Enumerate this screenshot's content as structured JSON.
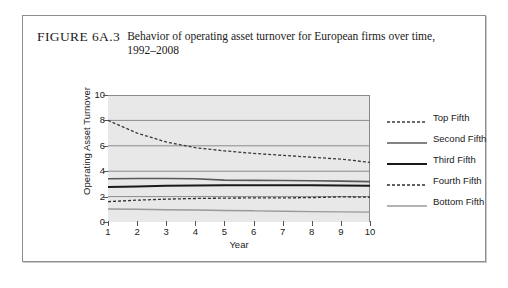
{
  "caption": {
    "label": "FIGURE 6A.3",
    "text": "Behavior of operating asset turnover for European firms over time, 1992–2008"
  },
  "chart_data": {
    "type": "line",
    "title": "Behavior of operating asset turnover for European firms over time, 1992–2008",
    "xlabel": "Year",
    "ylabel": "Operating Asset Turnover",
    "x": [
      1,
      2,
      3,
      4,
      5,
      6,
      7,
      8,
      9,
      10
    ],
    "xlim": [
      1,
      10
    ],
    "ylim": [
      0,
      10
    ],
    "yticks": [
      0,
      2,
      4,
      6,
      8,
      10
    ],
    "xticks": [
      1,
      2,
      3,
      4,
      5,
      6,
      7,
      8,
      9,
      10
    ],
    "grid": true,
    "legend_position": "right",
    "series": [
      {
        "name": "Top Fifth",
        "style": "dashed",
        "color": "#3a3a3a",
        "width": 1.3,
        "values": [
          8.0,
          7.0,
          6.3,
          5.85,
          5.6,
          5.4,
          5.25,
          5.1,
          4.95,
          4.7
        ]
      },
      {
        "name": "Second Fifth",
        "style": "solid",
        "color": "#585858",
        "width": 1.6,
        "values": [
          3.4,
          3.42,
          3.43,
          3.4,
          3.3,
          3.28,
          3.27,
          3.25,
          3.22,
          3.18
        ]
      },
      {
        "name": "Third Fifth",
        "style": "solid",
        "color": "#1a1a1a",
        "width": 2.0,
        "values": [
          2.75,
          2.8,
          2.85,
          2.88,
          2.9,
          2.9,
          2.9,
          2.9,
          2.88,
          2.85
        ]
      },
      {
        "name": "Fourth Fifth",
        "style": "dashed",
        "color": "#2e2e2e",
        "width": 1.3,
        "values": [
          1.6,
          1.72,
          1.8,
          1.85,
          1.88,
          1.9,
          1.9,
          1.92,
          1.98,
          1.95
        ]
      },
      {
        "name": "Bottom Fifth",
        "style": "solid",
        "color": "#9a9a9a",
        "width": 1.4,
        "values": [
          1.02,
          1.0,
          0.97,
          0.94,
          0.9,
          0.88,
          0.85,
          0.82,
          0.8,
          0.78
        ]
      }
    ]
  },
  "colors": {
    "plot_background": "#e8e8e8",
    "gridline": "#8a8a8a",
    "frame": "#8e8e8e"
  }
}
